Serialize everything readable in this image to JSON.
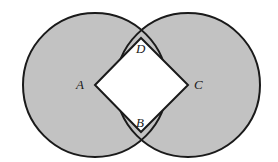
{
  "figure": {
    "name": "two-overlapping-circles-with-inscribed-square",
    "background_color": "#ffffff",
    "fill_color": "#c2c2c2",
    "stroke_color": "#1a1a1a",
    "square_fill_color": "#ffffff",
    "stroke_width": 2,
    "width": 278,
    "height": 162
  },
  "circles": [
    {
      "id": "left-circle",
      "cx": 95,
      "cy": 85,
      "r": 72,
      "center_label": "A"
    },
    {
      "id": "right-circle",
      "cx": 188,
      "cy": 85,
      "r": 72,
      "center_label": "C"
    }
  ],
  "square": {
    "id": "square-ABCD",
    "vertices": [
      {
        "label": "A",
        "x": 95,
        "y": 85
      },
      {
        "label": "D",
        "x": 141,
        "y": 38
      },
      {
        "label": "C",
        "x": 188,
        "y": 85
      },
      {
        "label": "B",
        "x": 141,
        "y": 132
      }
    ],
    "points_path": "95,85 141,38 188,85 141,132"
  },
  "labels": {
    "a": "A",
    "b": "B",
    "c": "C",
    "d": "D"
  }
}
